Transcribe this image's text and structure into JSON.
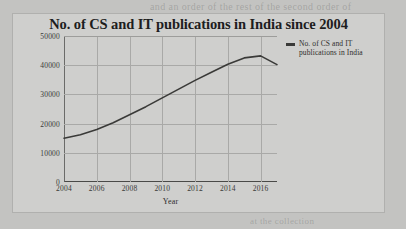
{
  "page": {
    "background_color": "#c3c3c1",
    "bleed_through_lines": [
      "and an order of the rest of the second order of",
      "the sales of",
      "in the state of the co",
      "an according to the same",
      "ar an in the of the same of",
      "in the sale of the same",
      "in the color of the same",
      "Final Indian Free Of Mines of Culture Of Staff",
      "of the collection of the same",
      "at the collection",
      "the or so in co",
      "the sol in"
    ]
  },
  "chart_card": {
    "background_color": "#cfcfcd",
    "border_color": "#b0b0ae"
  },
  "chart_data": {
    "type": "line",
    "title": "No. of CS and IT publications in India since 2004",
    "xlabel": "Year",
    "ylabel": "No. of CS and IT publications in India",
    "xlim": [
      2004,
      2017
    ],
    "ylim": [
      0,
      50000
    ],
    "xticks": [
      "2004",
      "2006",
      "2008",
      "2010",
      "2012",
      "2014",
      "2016"
    ],
    "xtick_values": [
      2004,
      2006,
      2008,
      2010,
      2012,
      2014,
      2016
    ],
    "yticks": [
      "0",
      "10000",
      "20000",
      "30000",
      "40000",
      "50000"
    ],
    "ytick_values": [
      0,
      10000,
      20000,
      30000,
      40000,
      50000
    ],
    "grid": true,
    "legend_position": "right",
    "line_color": "#3a3a38",
    "series": [
      {
        "name": "No. of CS and IT publications in India",
        "x": [
          2004,
          2005,
          2006,
          2007,
          2008,
          2009,
          2010,
          2011,
          2012,
          2013,
          2014,
          2015,
          2016,
          2017
        ],
        "values": [
          15000,
          16200,
          18000,
          20300,
          23000,
          25800,
          28800,
          31800,
          34800,
          37600,
          40300,
          42500,
          43200,
          40200
        ]
      }
    ]
  },
  "legend": {
    "label": "No. of CS and IT publications in India"
  }
}
